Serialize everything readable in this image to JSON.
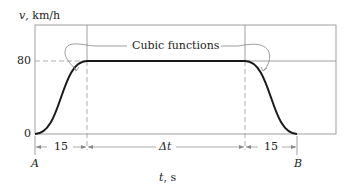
{
  "diagram": {
    "y_axis_label": {
      "var": "v",
      "unit": ", km/h"
    },
    "x_axis_label": {
      "var": "t",
      "unit": ", s"
    },
    "y_ticks": [
      "80",
      "0"
    ],
    "annotation": "Cubic functions",
    "intervals": [
      {
        "label": "15"
      },
      {
        "label": "Δt"
      },
      {
        "label": "15"
      }
    ],
    "points": {
      "start": "A",
      "end": "B"
    },
    "colors": {
      "line": "#1a1a1a",
      "frame": "#888888",
      "dashed": "#999999"
    }
  }
}
